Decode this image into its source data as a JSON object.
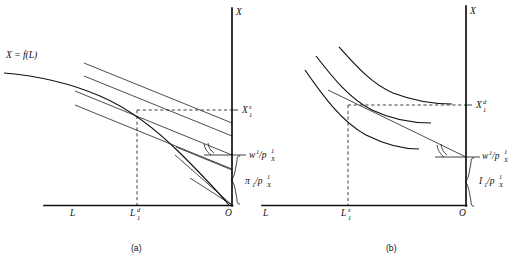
{
  "figure": {
    "title": "",
    "panels": [
      {
        "id": "a",
        "caption": "(a)",
        "role": "firm-profit-maximization",
        "axes": {
          "vertical_label": "X",
          "horizontal_label": "L",
          "origin_label": "O"
        },
        "curve_label": "X = f(L)",
        "annotations": {
          "output_level": "X",
          "output_level_sub": "1",
          "output_level_sup": "s",
          "labor_level": "L",
          "labor_level_sub": "1",
          "labor_level_sup": "d",
          "wage_ratio": "w",
          "wage_ratio_sup": "1",
          "wage_ratio_denom": "/p",
          "wage_ratio_denom_sub": "X",
          "wage_ratio_denom_sup": "1",
          "profit_ratio": "π",
          "profit_ratio_sub": "1",
          "profit_ratio_denom": "/p",
          "profit_ratio_denom_sub": "X",
          "profit_ratio_denom_sup": "1"
        },
        "isoprofit_line_count": 4,
        "tangency": {
          "x": "L1d",
          "y": "X1s"
        }
      },
      {
        "id": "b",
        "caption": "(b)",
        "role": "household-utility-maximization",
        "axes": {
          "vertical_label": "X",
          "horizontal_label": "L",
          "origin_label": "O"
        },
        "annotations": {
          "output_level": "X",
          "output_level_sub": "1",
          "output_level_sup": "d",
          "labor_level": "L",
          "labor_level_sub": "1",
          "labor_level_sup": "s",
          "wage_ratio": "w",
          "wage_ratio_sup": "1",
          "wage_ratio_denom": "/p",
          "wage_ratio_denom_sub": "X",
          "wage_ratio_denom_sup": "1",
          "income_ratio": "I",
          "income_ratio_sub": "1",
          "income_ratio_denom": "/p",
          "income_ratio_denom_sub": "X",
          "income_ratio_denom_sup": "1"
        },
        "indifference_curve_count": 3,
        "tangency": {
          "x": "L1s",
          "y": "X1d"
        }
      }
    ],
    "colors": {
      "ink": "#111111",
      "background": "#ffffff"
    }
  }
}
